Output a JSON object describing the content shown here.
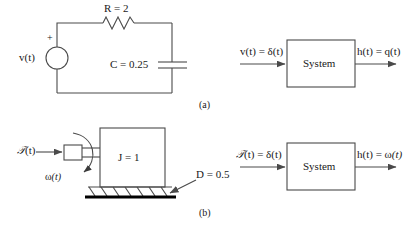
{
  "figure": {
    "caption_a": "(a)",
    "caption_b": "(b)",
    "stroke_color": "#4a4a4a",
    "text_color": "#1a1a1a",
    "ground_color": "#000000",
    "background": "#ffffff"
  },
  "circuit": {
    "source_label": "v(t)",
    "polarity_label": "+",
    "resistor_label": "R = 2",
    "capacitor_label": "C = 0.25",
    "source_icon": "voltage-source-circle-icon",
    "resistor_icon": "zigzag-resistor-icon",
    "capacitor_icon": "parallel-plate-capacitor-icon"
  },
  "block_a": {
    "input_label": "v(t) = δ(t)",
    "box_label": "System",
    "output_label": "h(t) = q(t)",
    "input_arrow_icon": "right-arrow-icon",
    "output_arrow_icon": "right-arrow-icon"
  },
  "mechanical": {
    "torque_label_script": "𝒯",
    "torque_label_rest": "(t)",
    "omega_label_omega": "ω",
    "omega_label_rest": "(t)",
    "inertia_label": "J = 1",
    "damper_label": "D = 0.5",
    "shaft_icon": "shaft-rectangle-icon",
    "rotation_icon": "curved-rotation-arrow-icon",
    "inertia_icon": "inertia-block-icon",
    "damper_icon": "hatched-ground-damper-icon",
    "torque_arrow_icon": "right-arrow-icon",
    "damper_pointer_icon": "arrow-pointer-icon"
  },
  "block_b": {
    "input_label_script": "𝒯",
    "input_label_rest": "(t) = δ(t)",
    "box_label": "System",
    "output_label_head": "h(t) = ω",
    "output_label_rest": "(t)",
    "input_arrow_icon": "right-arrow-icon",
    "output_arrow_icon": "right-arrow-icon"
  }
}
